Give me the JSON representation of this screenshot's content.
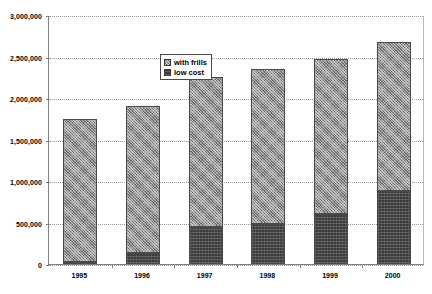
{
  "chart_data": {
    "type": "bar",
    "subtype": "stacked-column",
    "title": "",
    "xlabel": "",
    "ylabel": "",
    "categories": [
      "1995",
      "1996",
      "1997",
      "1998",
      "1999",
      "2000"
    ],
    "series": [
      {
        "name": "low cost",
        "legend_key": "lowcost",
        "values": [
          20000,
          130000,
          450000,
          480000,
          600000,
          880000
        ]
      },
      {
        "name": "with frills",
        "legend_key": "frills",
        "values": [
          1730000,
          1770000,
          1800000,
          1870000,
          1870000,
          1790000
        ]
      }
    ],
    "totals": [
      1750000,
      1900000,
      2250000,
      2350000,
      2470000,
      2670000
    ],
    "stack_order": [
      "low cost",
      "with frills"
    ],
    "ylim": [
      0,
      3000000
    ],
    "ytick_values": [
      0,
      500000,
      1000000,
      1500000,
      2000000,
      2500000,
      3000000
    ],
    "ytick_labels": [
      "0",
      "500,000",
      "1,000,000",
      "1,500,000",
      "2,000,000",
      "2,500,000",
      "3,000,000"
    ],
    "grid": true,
    "grid_style": "dotted-horizontal",
    "legend_position": "inside-top-left",
    "legend_entries": [
      {
        "label": "with frills",
        "key": "frills"
      },
      {
        "label": "low cost",
        "key": "lowcost"
      }
    ],
    "colors": {
      "with_frills": "#8f8f8f",
      "low_cost": "#3b3b3b",
      "grid": "#9a9a9a",
      "axis": "#808080",
      "text": "#000000",
      "background": "#ffffff"
    }
  }
}
